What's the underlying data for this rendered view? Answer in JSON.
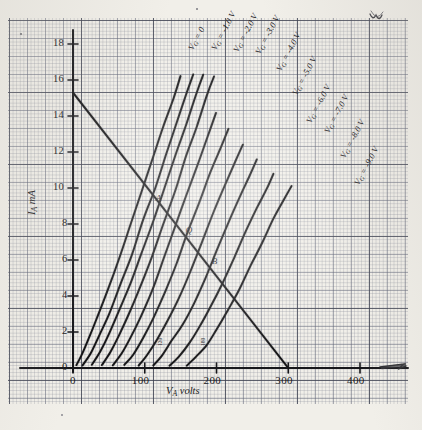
{
  "figure": {
    "kind": "hand-drawn-graph-paper-plot",
    "paper_color": "#f1efe9",
    "ink_color": "#141416",
    "grid_color": "#5f6476",
    "top_right_mark": "w"
  },
  "axes": {
    "x_label": "V",
    "x_label_sub": "A",
    "x_label_unit": "volts",
    "y_label": "I",
    "y_label_sub": "A",
    "y_label_unit": "mA",
    "x_ticks": [
      "0",
      "100",
      "200",
      "300",
      "400"
    ],
    "x_tick_values": [
      0,
      100,
      200,
      300,
      400
    ],
    "y_ticks": [
      "0",
      "2",
      "4",
      "6",
      "8",
      "10",
      "12",
      "14",
      "16",
      "18"
    ],
    "y_tick_values": [
      0,
      2,
      4,
      6,
      8,
      10,
      12,
      14,
      16,
      18
    ],
    "xlim": [
      0,
      420
    ],
    "ylim": [
      0,
      19
    ]
  },
  "annotations": {
    "x_marks": [
      "120",
      "180"
    ],
    "points": [
      {
        "name": "A",
        "label": "A",
        "x": 118,
        "y": 9.0
      },
      {
        "name": "Q",
        "label": "Q",
        "x": 160,
        "y": 7.2
      },
      {
        "name": "B",
        "label": "B",
        "x": 196,
        "y": 5.5
      }
    ]
  },
  "chart_data": {
    "type": "line",
    "title": "",
    "xlabel": "V_A volts",
    "ylabel": "I_A mA",
    "xlim": [
      0,
      420
    ],
    "ylim": [
      0,
      19
    ],
    "grid": true,
    "legend": "inline-curve-labels",
    "series": [
      {
        "name": "VG=0",
        "label": "V",
        "label_sub": "G",
        "label_rest": "= 0",
        "label_x": 186,
        "label_y": 47,
        "label_rot": -62,
        "points": [
          [
            5,
            0.15
          ],
          [
            12,
            0.7
          ],
          [
            22,
            1.6
          ],
          [
            34,
            2.8
          ],
          [
            48,
            4.3
          ],
          [
            64,
            6.1
          ],
          [
            80,
            8.0
          ],
          [
            96,
            9.9
          ],
          [
            112,
            11.8
          ],
          [
            126,
            13.4
          ],
          [
            140,
            15.0
          ],
          [
            150,
            16.2
          ]
        ]
      },
      {
        "name": "VG=-1.0V",
        "label": "V",
        "label_sub": "G",
        "label_rest": "= -1.0 V",
        "label_x": 209,
        "label_y": 47,
        "label_rot": -62,
        "points": [
          [
            14,
            0.15
          ],
          [
            24,
            0.8
          ],
          [
            36,
            1.8
          ],
          [
            50,
            3.0
          ],
          [
            66,
            4.6
          ],
          [
            82,
            6.3
          ],
          [
            98,
            8.2
          ],
          [
            114,
            10.0
          ],
          [
            130,
            11.9
          ],
          [
            144,
            13.5
          ],
          [
            158,
            15.2
          ],
          [
            168,
            16.3
          ]
        ]
      },
      {
        "name": "VG=-2.0V",
        "label": "V",
        "label_sub": "G",
        "label_rest": "= -2.0 V",
        "label_x": 231,
        "label_y": 49,
        "label_rot": -62,
        "points": [
          [
            26,
            0.15
          ],
          [
            38,
            0.9
          ],
          [
            50,
            1.9
          ],
          [
            64,
            3.1
          ],
          [
            80,
            4.7
          ],
          [
            96,
            6.4
          ],
          [
            112,
            8.2
          ],
          [
            128,
            10.1
          ],
          [
            144,
            12.0
          ],
          [
            158,
            13.6
          ],
          [
            172,
            15.3
          ],
          [
            182,
            16.3
          ]
        ]
      },
      {
        "name": "VG=-3.0V",
        "label": "V",
        "label_sub": "G",
        "label_rest": "= -3.0 V",
        "label_x": 253,
        "label_y": 51,
        "label_rot": -62,
        "points": [
          [
            40,
            0.15
          ],
          [
            52,
            0.85
          ],
          [
            64,
            1.8
          ],
          [
            78,
            3.0
          ],
          [
            94,
            4.5
          ],
          [
            110,
            6.2
          ],
          [
            126,
            8.0
          ],
          [
            142,
            9.9
          ],
          [
            158,
            11.8
          ],
          [
            172,
            13.4
          ],
          [
            186,
            15.1
          ],
          [
            196,
            16.2
          ]
        ]
      },
      {
        "name": "VG=-4.0V",
        "label": "V",
        "label_sub": "G",
        "label_rest": "= -4.0 V",
        "label_x": 274,
        "label_y": 68,
        "label_rot": -62,
        "points": [
          [
            56,
            0.15
          ],
          [
            68,
            0.8
          ],
          [
            80,
            1.7
          ],
          [
            94,
            2.8
          ],
          [
            110,
            4.3
          ],
          [
            126,
            6.0
          ],
          [
            142,
            7.8
          ],
          [
            158,
            9.6
          ],
          [
            174,
            11.4
          ],
          [
            188,
            12.9
          ],
          [
            200,
            14.2
          ]
        ]
      },
      {
        "name": "VG=-5.0V",
        "label": "V",
        "label_sub": "G",
        "label_rest": "= -5.0 V",
        "label_x": 290,
        "label_y": 92,
        "label_rot": -62,
        "points": [
          [
            72,
            0.15
          ],
          [
            84,
            0.75
          ],
          [
            98,
            1.7
          ],
          [
            112,
            2.8
          ],
          [
            128,
            4.2
          ],
          [
            144,
            5.8
          ],
          [
            160,
            7.5
          ],
          [
            176,
            9.2
          ],
          [
            192,
            10.9
          ],
          [
            206,
            12.3
          ],
          [
            216,
            13.3
          ]
        ]
      },
      {
        "name": "VG=-6.0V",
        "label": "V",
        "label_sub": "G",
        "label_rest": "= -6.0 V",
        "label_x": 304,
        "label_y": 120,
        "label_rot": -62,
        "points": [
          [
            92,
            0.15
          ],
          [
            104,
            0.7
          ],
          [
            118,
            1.6
          ],
          [
            132,
            2.6
          ],
          [
            148,
            3.9
          ],
          [
            164,
            5.4
          ],
          [
            180,
            7.0
          ],
          [
            196,
            8.6
          ],
          [
            212,
            10.2
          ],
          [
            226,
            11.5
          ],
          [
            236,
            12.4
          ]
        ]
      },
      {
        "name": "VG=-7.0V",
        "label": "V",
        "label_sub": "G",
        "label_rest": "= -7.0 V",
        "label_x": 322,
        "label_y": 130,
        "label_rot": -62,
        "points": [
          [
            112,
            0.15
          ],
          [
            124,
            0.65
          ],
          [
            138,
            1.5
          ],
          [
            152,
            2.4
          ],
          [
            168,
            3.6
          ],
          [
            184,
            5.0
          ],
          [
            200,
            6.5
          ],
          [
            216,
            8.0
          ],
          [
            232,
            9.5
          ],
          [
            246,
            10.7
          ],
          [
            256,
            11.6
          ]
        ]
      },
      {
        "name": "VG=-8.0V",
        "label": "V",
        "label_sub": "G",
        "label_rest": "= -8.0 V",
        "label_x": 338,
        "label_y": 155,
        "label_rot": -62,
        "points": [
          [
            135,
            0.15
          ],
          [
            148,
            0.6
          ],
          [
            162,
            1.4
          ],
          [
            176,
            2.3
          ],
          [
            192,
            3.4
          ],
          [
            208,
            4.7
          ],
          [
            224,
            6.1
          ],
          [
            240,
            7.5
          ],
          [
            256,
            8.9
          ],
          [
            270,
            10.0
          ],
          [
            280,
            10.8
          ]
        ]
      },
      {
        "name": "VG=-9.0V",
        "label": "V",
        "label_sub": "G",
        "label_rest": "= -9.0 V",
        "label_x": 352,
        "label_y": 182,
        "label_rot": -62,
        "points": [
          [
            158,
            0.15
          ],
          [
            172,
            0.6
          ],
          [
            186,
            1.3
          ],
          [
            200,
            2.1
          ],
          [
            216,
            3.2
          ],
          [
            232,
            4.4
          ],
          [
            248,
            5.7
          ],
          [
            264,
            7.0
          ],
          [
            280,
            8.3
          ],
          [
            294,
            9.4
          ],
          [
            304,
            10.1
          ]
        ]
      }
    ],
    "load_line": {
      "name": "load-line",
      "from": [
        0,
        15.3
      ],
      "to": [
        300,
        0
      ],
      "note": "DC load line intersecting curves at A, Q, B"
    }
  }
}
